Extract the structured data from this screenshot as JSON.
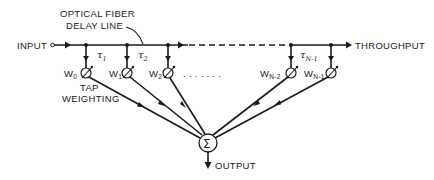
{
  "diagram": {
    "labels": {
      "fiber_line": [
        "OPTICAL FIBER",
        "DELAY LINE"
      ],
      "input": "INPUT",
      "throughput": "THROUGHPUT",
      "output": "OUTPUT",
      "tap_weighting": [
        "TAP",
        "WEIGHTING"
      ],
      "summer": "Σ"
    },
    "delays": [
      {
        "symbol": "τ",
        "sub": "1"
      },
      {
        "symbol": "τ",
        "sub": "2"
      },
      {
        "symbol": "τ",
        "sub": "N-1"
      }
    ],
    "weights": [
      {
        "symbol": "W",
        "sub": "0"
      },
      {
        "symbol": "W",
        "sub": "1"
      },
      {
        "symbol": "W",
        "sub": "2"
      },
      {
        "symbol": "W",
        "sub": "N-2"
      },
      {
        "symbol": "W",
        "sub": "N-1"
      }
    ],
    "ellipsis": ". . . . . . ."
  }
}
